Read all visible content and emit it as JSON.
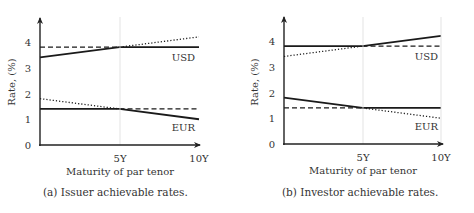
{
  "chart_data": [
    {
      "type": "line",
      "id": "a",
      "caption": "(a) Issuer achievable rates.",
      "xlabel": "Maturity of par tenor",
      "ylabel": "Rate, (%)",
      "x_ticks": [
        "5Y",
        "10Y"
      ],
      "y_ticks": [
        0,
        1,
        2,
        3,
        4
      ],
      "xlim": [
        0,
        10
      ],
      "ylim": [
        0,
        4.5
      ],
      "grid": "vertical line at 5Y",
      "series": [
        {
          "name": "USD solid",
          "style": "solid",
          "x": [
            0,
            5,
            10
          ],
          "y": [
            3.4,
            3.8,
            3.8
          ]
        },
        {
          "name": "USD dashed",
          "style": "dashed",
          "x": [
            0,
            5
          ],
          "y": [
            3.8,
            3.8
          ]
        },
        {
          "name": "USD dotted",
          "style": "dotted",
          "x": [
            5,
            10
          ],
          "y": [
            3.8,
            4.2
          ]
        },
        {
          "name": "EUR solid",
          "style": "solid",
          "x": [
            0,
            5,
            10
          ],
          "y": [
            1.4,
            1.4,
            1.0
          ]
        },
        {
          "name": "EUR dotted",
          "style": "dotted",
          "x": [
            0,
            5
          ],
          "y": [
            1.8,
            1.4
          ]
        },
        {
          "name": "EUR dashed",
          "style": "dashed",
          "x": [
            5,
            10
          ],
          "y": [
            1.4,
            1.4
          ]
        }
      ],
      "annotations": [
        "USD",
        "EUR"
      ]
    },
    {
      "type": "line",
      "id": "b",
      "caption": "(b) Investor achievable rates.",
      "xlabel": "Maturity of par tenor",
      "ylabel": "Rate, (%)",
      "x_ticks": [
        "5Y",
        "10Y"
      ],
      "y_ticks": [
        0,
        1,
        2,
        3,
        4
      ],
      "xlim": [
        0,
        10
      ],
      "ylim": [
        0,
        4.5
      ],
      "grid": "vertical lines at 5Y and 10Y",
      "series": [
        {
          "name": "USD solid",
          "style": "solid",
          "x": [
            0,
            5,
            10
          ],
          "y": [
            3.8,
            3.8,
            4.2
          ]
        },
        {
          "name": "USD dotted",
          "style": "dotted",
          "x": [
            0,
            5
          ],
          "y": [
            3.4,
            3.8
          ]
        },
        {
          "name": "USD dashed",
          "style": "dashed",
          "x": [
            5,
            10
          ],
          "y": [
            3.8,
            3.8
          ]
        },
        {
          "name": "EUR solid",
          "style": "solid",
          "x": [
            0,
            5,
            10
          ],
          "y": [
            1.8,
            1.4,
            1.4
          ]
        },
        {
          "name": "EUR dashed",
          "style": "dashed",
          "x": [
            0,
            5
          ],
          "y": [
            1.4,
            1.4
          ]
        },
        {
          "name": "EUR dotted",
          "style": "dotted",
          "x": [
            5,
            10
          ],
          "y": [
            1.4,
            1.0
          ]
        }
      ],
      "annotations": [
        "USD",
        "EUR"
      ]
    }
  ],
  "labels": {
    "a": {
      "usd": "USD",
      "eur": "EUR",
      "x5": "5Y",
      "x10": "10Y",
      "xlabel": "Maturity of par tenor",
      "ylabel": "Rate, (%)",
      "caption": "(a) Issuer achievable rates.",
      "y0": "0",
      "y1": "1",
      "y2": "2",
      "y3": "3",
      "y4": "4"
    },
    "b": {
      "usd": "USD",
      "eur": "EUR",
      "x5": "5Y",
      "x10": "10Y",
      "xlabel": "Maturity of par tenor",
      "ylabel": "Rate, (%)",
      "caption": "(b) Investor achievable rates.",
      "y0": "0",
      "y1": "1",
      "y2": "2",
      "y3": "3",
      "y4": "4"
    }
  }
}
